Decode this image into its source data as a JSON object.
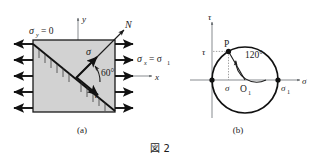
{
  "figure": {
    "caption": "図 2",
    "panels": [
      {
        "id": "a",
        "label": "(a)",
        "name": "stress-element-diagram",
        "labels": {
          "sigma_y": "σ",
          "sigma_y_sub": "y",
          "sigma_y_eq": "= 0",
          "sigma_x": "σ",
          "sigma_x_sub": "x",
          "sigma_x_eq": "= σ",
          "sigma_x_eq_sub": "1",
          "axis_y": "y",
          "axis_x": "x",
          "normal_n": "N",
          "sigma_arrow": "σ",
          "tau_arrow": "τ",
          "angle": "60°"
        },
        "arrow_count_left": 5,
        "arrow_count_right": 5
      },
      {
        "id": "b",
        "label": "(b)",
        "name": "mohr-circle-diagram",
        "labels": {
          "axis_tau": "τ",
          "axis_sigma": "σ",
          "point_p": "P",
          "center": "O",
          "center_sub": "1",
          "tau_value": "τ",
          "sigma_value": "σ",
          "sigma_one": "σ",
          "sigma_one_sub": "1",
          "angle": "120°"
        }
      }
    ]
  },
  "colors": {
    "element_fill": "#d2d2d2",
    "stroke": "#1a1a1a",
    "grid": "#9a9a9a",
    "background": "#ffffff"
  }
}
